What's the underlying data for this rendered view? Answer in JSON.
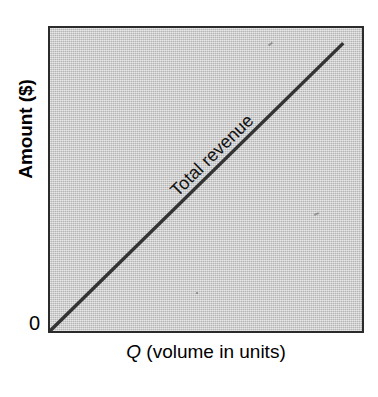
{
  "figure": {
    "background_color": "#ffffff",
    "plot_background_color": "#c9c9c9",
    "border_color": "#2b2b2b",
    "line_color": "#333333"
  },
  "chart_data": {
    "type": "line",
    "title": "",
    "subtitle": "",
    "xlabel_full": "Q (volume in units)",
    "xlabel_symbol": "Q",
    "xlabel_rest": " (volume in units)",
    "ylabel": "Amount ($)",
    "origin_label": "0",
    "grid": false,
    "legend_position": "inline-along-line",
    "xlim": [
      0,
      100
    ],
    "ylim": [
      0,
      100
    ],
    "x_ticks": [],
    "y_ticks": [],
    "x_tick_labels": [],
    "y_tick_labels": [],
    "annotations": [
      {
        "text": "Total revenue",
        "x": 42,
        "y": 50,
        "rotation": 44.5,
        "placement": "above-line"
      }
    ],
    "series": [
      {
        "name": "Total revenue",
        "type": "line",
        "color": "#333333",
        "linewidth": 3,
        "x": [
          0,
          94
        ],
        "y": [
          0,
          95
        ],
        "slope_description": "straight line through the origin with constant positive slope"
      }
    ]
  }
}
